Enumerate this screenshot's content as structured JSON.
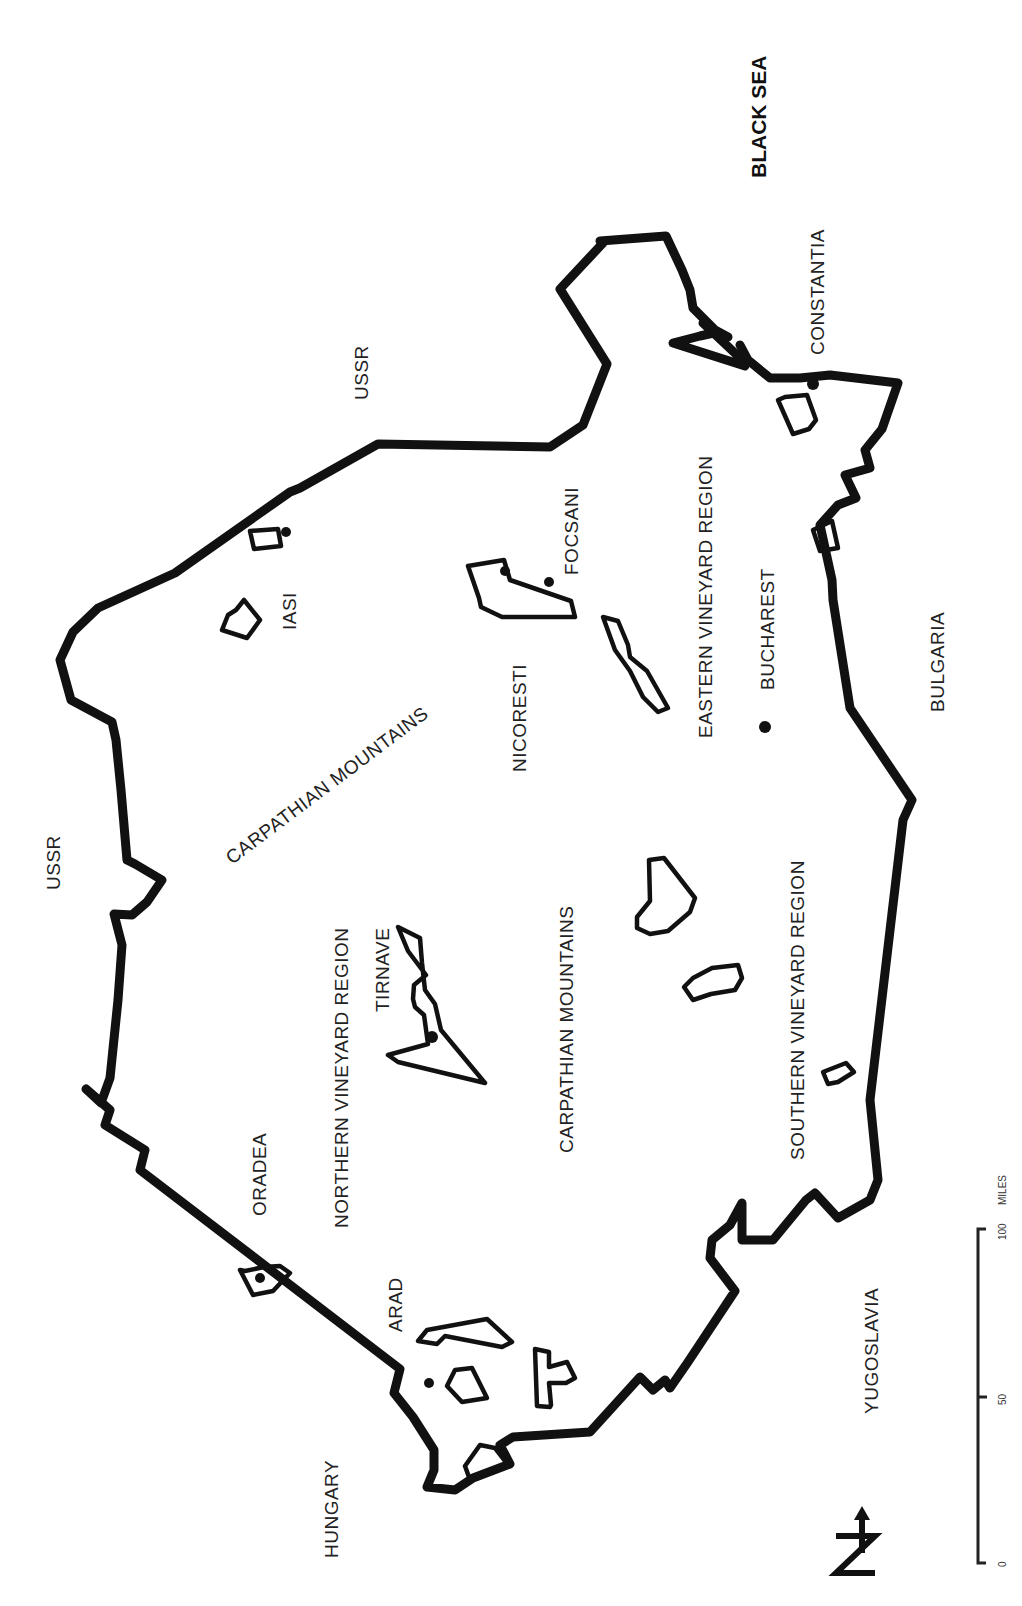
{
  "map": {
    "orientation": "rotated 90 degrees clockwise (north points left)",
    "colors": {
      "ink": "#111111",
      "background": "#ffffff"
    },
    "labels": {
      "black_sea": "BLACK SEA",
      "constantia": "CONSTANTIA",
      "ussr_east": "USSR",
      "ussr_north": "USSR",
      "focsani": "FOCSANI",
      "nicoresti": "NICORESTI",
      "iasi": "IASI",
      "carpathian_mountains_1": "CARPATHIAN MOUNTAINS",
      "carpathian_mountains_2": "CARPATHIAN MOUNTAINS",
      "eastern_region": "EASTERN VINEYARD REGION",
      "bucharest": "BUCHAREST",
      "bulgaria": "BULGARIA",
      "northern_region": "NORTHERN VINEYARD REGION",
      "tirnave": "TIRNAVE",
      "southern_region": "SOUTHERN VINEYARD REGION",
      "oradea": "ORADEA",
      "arad": "ARAD",
      "hungary": "HUNGARY",
      "yugoslavia": "YUGOSLAVIA"
    },
    "scale_bar": {
      "ticks": [
        "0",
        "50",
        "100"
      ],
      "unit": "MILES"
    },
    "north_arrow": {
      "icon": "north-arrow-icon",
      "letter": "N"
    }
  }
}
